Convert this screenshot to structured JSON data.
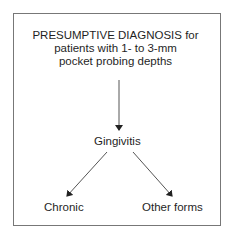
{
  "diagram": {
    "title_lines": [
      "PRESUMPTIVE DIAGNOSIS for",
      "patients with 1- to 3-mm",
      "pocket probing depths"
    ],
    "nodes": {
      "root": "Gingivitis",
      "left_child": "Chronic",
      "right_child": "Other forms"
    },
    "edges": [
      {
        "from": "title",
        "to": "Gingivitis"
      },
      {
        "from": "Gingivitis",
        "to": "Chronic"
      },
      {
        "from": "Gingivitis",
        "to": "Other forms"
      }
    ],
    "colors": {
      "line": "#555555",
      "border": "#777777",
      "text": "#1f1f1f"
    }
  }
}
